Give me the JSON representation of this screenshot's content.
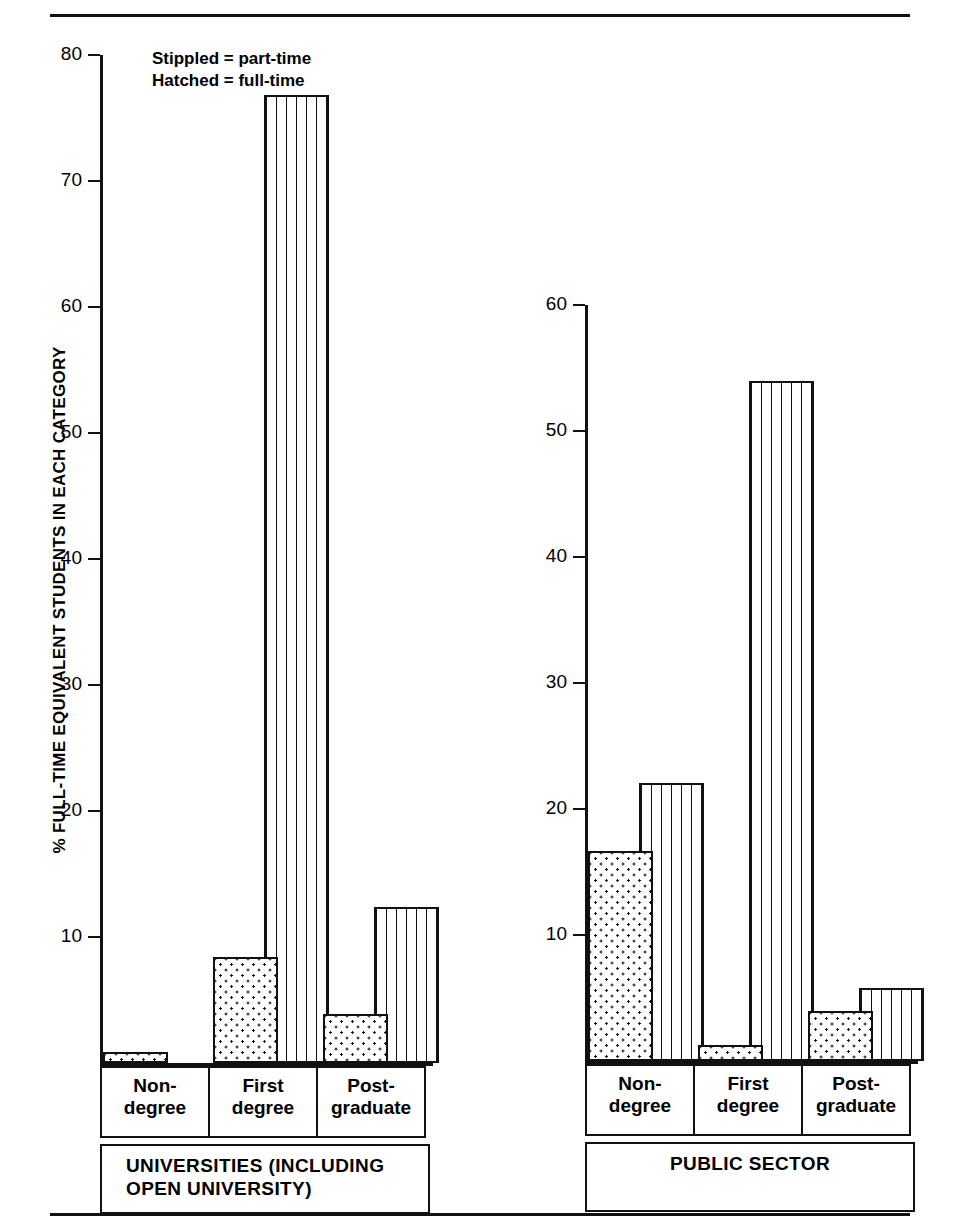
{
  "legend": {
    "line1": "Stippled = part-time",
    "line2": "Hatched = full-time"
  },
  "axis": {
    "ylabel": "% FULL-TIME EQUIVALENT STUDENTS IN EACH CATEGORY"
  },
  "panels": [
    {
      "id": "universities",
      "group_label": "UNIVERSITIES (INCLUDING\nOPEN UNIVERSITY)",
      "group_label_line1": "UNIVERSITIES (INCLUDING",
      "group_label_line2": "OPEN UNIVERSITY)",
      "ticks": [
        "10",
        "20",
        "30",
        "40",
        "50",
        "60",
        "70",
        "80"
      ],
      "categories": [
        {
          "line1": "Non-",
          "line2": "degree"
        },
        {
          "line1": "First",
          "line2": "degree"
        },
        {
          "line1": "Post-",
          "line2": "graduate"
        }
      ]
    },
    {
      "id": "public-sector",
      "group_label_line1": "PUBLIC SECTOR",
      "group_label_line2": "",
      "ticks": [
        "10",
        "20",
        "30",
        "40",
        "50",
        "60"
      ],
      "categories": [
        {
          "line1": "Non-",
          "line2": "degree"
        },
        {
          "line1": "First",
          "line2": "degree"
        },
        {
          "line1": "Post-",
          "line2": "graduate"
        }
      ]
    }
  ],
  "chart_data": [
    {
      "type": "bar",
      "title": "UNIVERSITIES (INCLUDING OPEN UNIVERSITY)",
      "xlabel": "",
      "ylabel": "% FULL-TIME EQUIVALENT STUDENTS IN EACH CATEGORY",
      "categories": [
        "Non-degree",
        "First degree",
        "Post-graduate"
      ],
      "series": [
        {
          "name": "Stippled = part-time",
          "values": [
            0.9,
            8.4,
            3.9
          ]
        },
        {
          "name": "Hatched = full-time",
          "values": [
            0.0,
            76.8,
            12.4
          ]
        }
      ],
      "ylim": [
        0,
        80
      ],
      "yticks": [
        10,
        20,
        30,
        40,
        50,
        60,
        70,
        80
      ],
      "grid": false,
      "legend_position": "top-left"
    },
    {
      "type": "bar",
      "title": "PUBLIC SECTOR",
      "xlabel": "",
      "ylabel": "% FULL-TIME EQUIVALENT STUDENTS IN EACH CATEGORY",
      "categories": [
        "Non-degree",
        "First degree",
        "Post-graduate"
      ],
      "series": [
        {
          "name": "Stippled = part-time",
          "values": [
            16.7,
            1.3,
            4.0
          ]
        },
        {
          "name": "Hatched = full-time",
          "values": [
            22.1,
            54.0,
            5.8
          ]
        }
      ],
      "ylim": [
        0,
        60
      ],
      "yticks": [
        10,
        20,
        30,
        40,
        50,
        60
      ],
      "grid": false,
      "legend_position": "top-left"
    }
  ]
}
